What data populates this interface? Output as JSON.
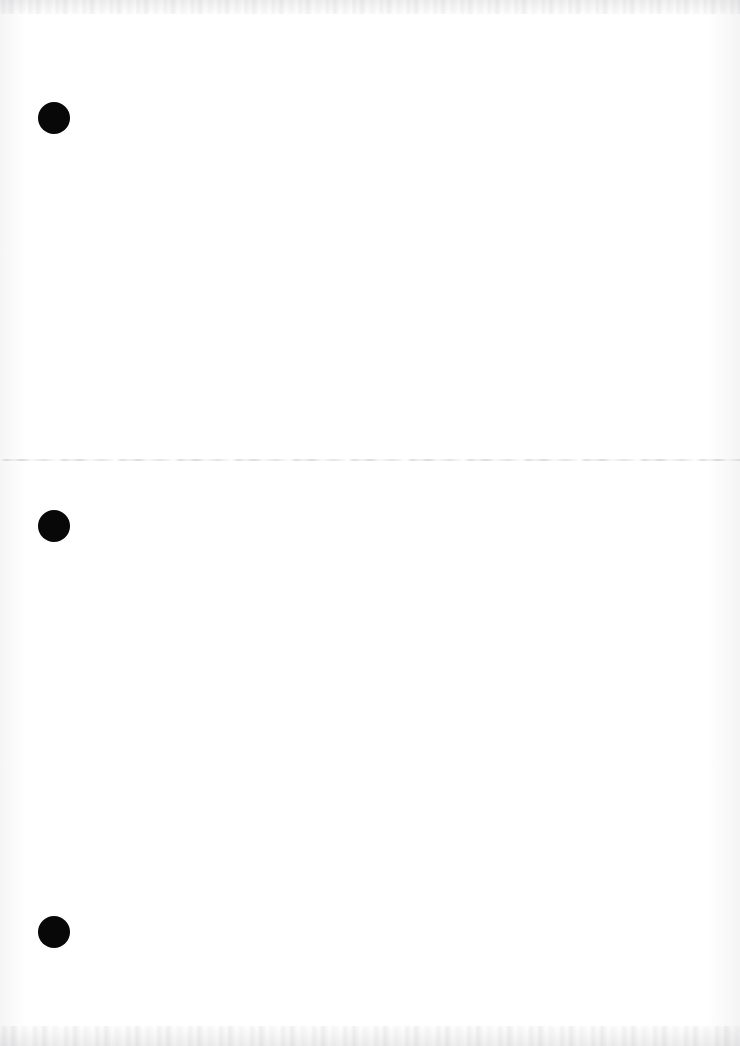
{
  "page": {
    "kind": "scanned-document-page",
    "background_color": "#ffffff",
    "width": 740,
    "height": 1046,
    "body_text": ""
  },
  "ink_color": "#080808",
  "rule_color": "#9a9a9f",
  "bullets": [
    {
      "name": "bullet-1",
      "shape": "filled-circle",
      "x": 38,
      "y": 102,
      "size": 32
    },
    {
      "name": "bullet-2",
      "shape": "filled-circle",
      "x": 38,
      "y": 510,
      "size": 32
    },
    {
      "name": "bullet-3",
      "shape": "filled-circle",
      "x": 38,
      "y": 916,
      "size": 32
    }
  ],
  "section_rule": {
    "name": "section-divider",
    "y": 459,
    "x": 0,
    "width": 740
  },
  "artifacts": {
    "top_edge_noise": "speckled-gray-band",
    "bottom_edge_noise": "speckled-gray-band",
    "left_edge_shading": "faint-vertical-gradient",
    "right_edge_shading": "faint-vertical-gradient"
  }
}
